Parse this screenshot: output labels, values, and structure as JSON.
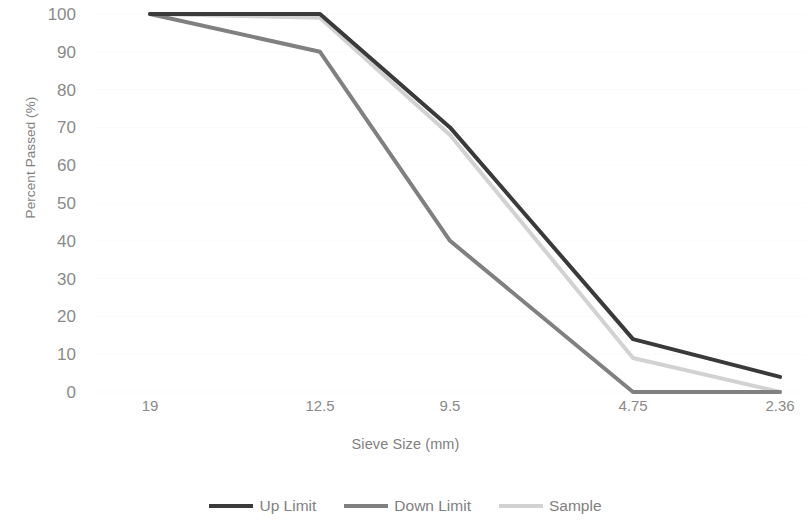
{
  "chart_data": {
    "type": "line",
    "title": "",
    "xlabel": "Sieve Size (mm)",
    "ylabel": "Percent Passed (%)",
    "categories": [
      "19",
      "12.5",
      "9.5",
      "4.75",
      "2.36"
    ],
    "ylim": [
      0,
      100
    ],
    "y_ticks": [
      "0",
      "10",
      "20",
      "30",
      "40",
      "50",
      "60",
      "70",
      "80",
      "90",
      "100"
    ],
    "grid": true,
    "legend_position": "bottom",
    "series": [
      {
        "name": "Up Limit",
        "color": "#3a3a3a",
        "values": [
          100,
          100,
          70,
          14,
          4
        ]
      },
      {
        "name": "Down Limit",
        "color": "#808080",
        "values": [
          100,
          90,
          40,
          0,
          0
        ]
      },
      {
        "name": "Sample",
        "color": "#d2d2d2",
        "values": [
          100,
          99,
          68,
          9,
          0
        ]
      }
    ]
  },
  "axes": {
    "y_title": "Percent Passed (%)",
    "x_title": "Sieve Size (mm)",
    "y_ticks": [
      "100",
      "90",
      "80",
      "70",
      "60",
      "50",
      "40",
      "30",
      "20",
      "10",
      "0"
    ],
    "x_ticks": [
      "19",
      "12.5",
      "9.5",
      "4.75",
      "2.36"
    ]
  },
  "legend": {
    "items": [
      {
        "label": "Up Limit",
        "color": "#3a3a3a"
      },
      {
        "label": "Down Limit",
        "color": "#808080"
      },
      {
        "label": "Sample",
        "color": "#d2d2d2"
      }
    ]
  }
}
